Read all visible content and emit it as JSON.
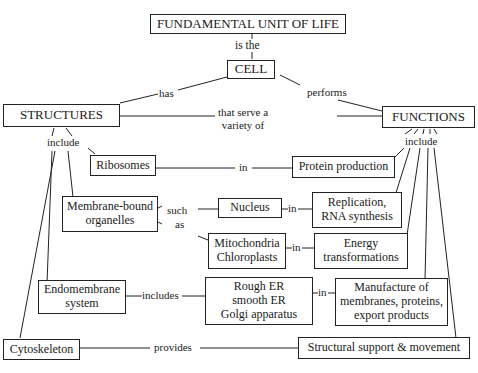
{
  "diagram": {
    "type": "concept-map",
    "nodes": {
      "fundamental": "FUNDAMENTAL UNIT OF LIFE",
      "cell": "CELL",
      "structures": "STRUCTURES",
      "functions": "FUNCTIONS",
      "ribosomes": "Ribosomes",
      "protein_production": "Protein production",
      "membrane_bound_1": "Membrane-bound",
      "membrane_bound_2": "organelles",
      "nucleus": "Nucleus",
      "replication_1": "Replication,",
      "replication_2": "RNA synthesis",
      "mito_1": "Mitochondria",
      "mito_2": "Chloroplasts",
      "energy_1": "Energy",
      "energy_2": "transformations",
      "endomembrane_1": "Endomembrane",
      "endomembrane_2": "system",
      "er_1": "Rough ER",
      "er_2": "smooth ER",
      "er_3": "Golgi apparatus",
      "manufacture_1": "Manufacture of",
      "manufacture_2": "membranes, proteins,",
      "manufacture_3": "export products",
      "cytoskeleton": "Cytoskeleton",
      "structural_support": "Structural support & movement"
    },
    "links": {
      "is_the": "is the",
      "has": "has",
      "performs": "performs",
      "serve_1": "that serve a",
      "serve_2": "variety of",
      "include_structures": "include",
      "include_functions": "include",
      "ribosomes_in": "in",
      "such": "such",
      "as": "as",
      "nucleus_in": "in",
      "mito_in": "in",
      "includes": "includes",
      "er_in": "in",
      "provides": "provides"
    }
  }
}
